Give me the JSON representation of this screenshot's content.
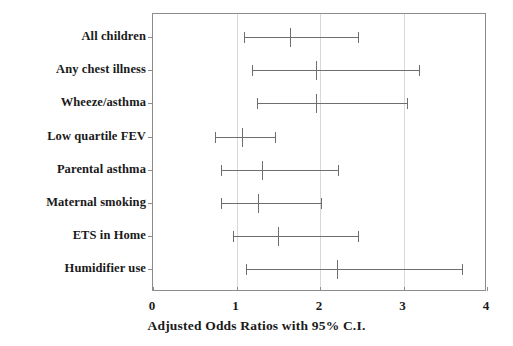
{
  "chart_data": {
    "type": "scatter",
    "title": "",
    "xlabel": "Adjusted Odds Ratios with 95% C.I.",
    "ylabel": "",
    "xlim": [
      0,
      4
    ],
    "xticks": [
      "0",
      "1",
      "2",
      "3",
      "4"
    ],
    "xtick_values": [
      0,
      1,
      2,
      3,
      4
    ],
    "gridlines_x": [
      1,
      2,
      3
    ],
    "grid": true,
    "legend": null,
    "reference_line": 1,
    "categories": [
      "All children",
      "Any chest illness",
      "Wheeze/asthma",
      "Low quartile FEV",
      "Parental asthma",
      "Maternal smoking",
      "ETS in Home",
      "Humidifier use"
    ],
    "points": [
      {
        "label": "All children",
        "or": 1.64,
        "lower": 1.09,
        "upper": 2.46
      },
      {
        "label": "Any chest illness",
        "or": 1.95,
        "lower": 1.19,
        "upper": 3.19
      },
      {
        "label": "Wheeze/asthma",
        "or": 1.95,
        "lower": 1.24,
        "upper": 3.04
      },
      {
        "label": "Low quartile FEV",
        "or": 1.06,
        "lower": 0.74,
        "upper": 1.46
      },
      {
        "label": "Parental asthma",
        "or": 1.31,
        "lower": 0.81,
        "upper": 2.21
      },
      {
        "label": "Maternal smoking",
        "or": 1.26,
        "lower": 0.81,
        "upper": 2.01
      },
      {
        "label": "ETS in Home",
        "or": 1.5,
        "lower": 0.96,
        "upper": 2.45
      },
      {
        "label": "Humidifier use",
        "or": 2.2,
        "lower": 1.11,
        "upper": 3.7
      }
    ]
  },
  "style": {
    "frame_color": "#8c8c8c",
    "grid_color": "#d8d8d8",
    "marker_color": "#6e6e6e",
    "text_color": "#1a1a1a",
    "background": "#ffffff"
  }
}
